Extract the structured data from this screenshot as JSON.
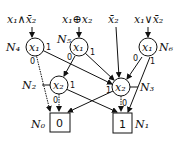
{
  "inputs": [
    {
      "id": "in1",
      "label": "x₁∧x̄₂"
    },
    {
      "id": "in2",
      "label": "x₁⊕x₂"
    },
    {
      "id": "in3",
      "label": "x̄₂"
    },
    {
      "id": "in4",
      "label": "x₁∨x̄₂"
    }
  ],
  "nodes": [
    {
      "id": "N4",
      "name": "N₄",
      "var": "x₁"
    },
    {
      "id": "N5",
      "name": "N₅",
      "var": "x₁"
    },
    {
      "id": "N6",
      "name": "N₆",
      "var": "x₁"
    },
    {
      "id": "N2",
      "name": "N₂",
      "var": "x₂"
    },
    {
      "id": "N3",
      "name": "N₃",
      "var": "x₂"
    }
  ],
  "terminals": [
    {
      "id": "N0",
      "name": "N₀",
      "value": "0"
    },
    {
      "id": "N1",
      "name": "N₁",
      "value": "1"
    }
  ],
  "edges": [
    {
      "from": "N4",
      "to": "N0",
      "label": "0"
    },
    {
      "from": "N4",
      "to": "N3",
      "label": "1"
    },
    {
      "from": "N5",
      "to": "N2",
      "label": "0"
    },
    {
      "from": "N5",
      "to": "N3",
      "label": "1"
    },
    {
      "from": "N6",
      "to": "N3",
      "label": "0"
    },
    {
      "from": "N6",
      "to": "N1",
      "label": "1"
    },
    {
      "from": "N2",
      "to": "N0",
      "label": "0"
    },
    {
      "from": "N2",
      "to": "N1",
      "label": "1"
    },
    {
      "from": "N3",
      "to": "N1",
      "label": "0"
    },
    {
      "from": "N3",
      "to": "N0",
      "label": "1"
    }
  ]
}
